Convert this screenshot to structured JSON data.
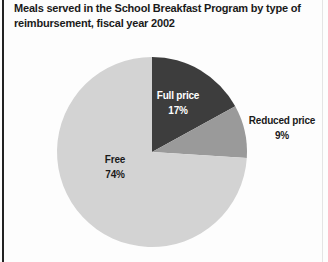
{
  "header": {
    "line1": "Meals served in the School Breakfast Program by type of",
    "line2": "reimbursement, fiscal year 2002"
  },
  "colors": {
    "full_price_slice": "#3d3d3d",
    "reduced_price_slice": "#9a9a9a",
    "free_slice": "#d3d3d3",
    "left_rule": "#222222",
    "right_rule": "#e4e4e4",
    "title_text": "#1a1a1a",
    "inside_dark_label_text": "#ffffff",
    "background": "#fdfdfd"
  },
  "chart_data": {
    "type": "pie",
    "title": "Meals served in the School Breakfast Program by type of reimbursement, fiscal year 2002",
    "start_angle_deg": -90,
    "direction": "clockwise",
    "total": 100,
    "legend_position": "none",
    "slices": [
      {
        "label": "Full price",
        "value": 17,
        "pct_label": "17%",
        "color": "#3d3d3d",
        "label_placement": "inside",
        "label_text_color": "#ffffff"
      },
      {
        "label": "Reduced price",
        "value": 9,
        "pct_label": "9%",
        "color": "#9a9a9a",
        "label_placement": "outside-right",
        "label_text_color": "#1a1a1a"
      },
      {
        "label": "Free",
        "value": 74,
        "pct_label": "74%",
        "color": "#d3d3d3",
        "label_placement": "inside",
        "label_text_color": "#1a1a1a"
      }
    ]
  }
}
